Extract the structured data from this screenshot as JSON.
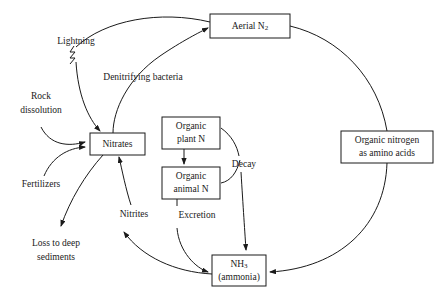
{
  "diagram": {
    "background_color": "#ffffff",
    "line_color": "#1a1a1a",
    "nodes": [
      {
        "id": "aerial_n2",
        "label_line1": "Aerial N",
        "label_sub": "2",
        "label_line2": ""
      },
      {
        "id": "nitrates",
        "label_line1": "Nitrates",
        "label_sub": "",
        "label_line2": ""
      },
      {
        "id": "organic_plant_n",
        "label_line1": "Organic",
        "label_sub": "",
        "label_line2": "plant N"
      },
      {
        "id": "organic_animal_n",
        "label_line1": "Organic",
        "label_sub": "",
        "label_line2": "animal N"
      },
      {
        "id": "ammonia",
        "label_line1": "NH",
        "label_sub": "3",
        "label_line2": "(ammonia)"
      },
      {
        "id": "organic_nitrogen",
        "label_line1": "Organic nitrogen",
        "label_sub": "",
        "label_line2": "as amino acids"
      }
    ],
    "edge_labels": [
      {
        "id": "lightning",
        "text": "Lightning"
      },
      {
        "id": "denitrifying_bacteria",
        "text": "Denitrifying bacteria"
      },
      {
        "id": "rock_dissolution_1",
        "text": "Rock"
      },
      {
        "id": "rock_dissolution_2",
        "text": "dissolution"
      },
      {
        "id": "fertilizers",
        "text": "Fertilizers"
      },
      {
        "id": "loss_deep_1",
        "text": "Loss to deep"
      },
      {
        "id": "loss_deep_2",
        "text": "sediments"
      },
      {
        "id": "nitrites",
        "text": "Nitrites"
      },
      {
        "id": "excretion",
        "text": "Excretion"
      },
      {
        "id": "decay",
        "text": "Decay"
      }
    ]
  }
}
